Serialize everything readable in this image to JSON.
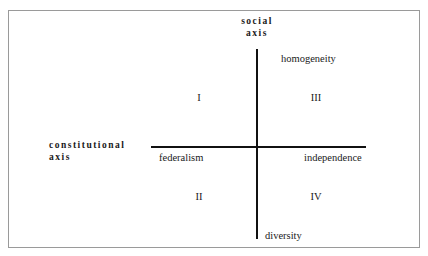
{
  "diagram": {
    "axes": {
      "vertical": {
        "title_line1": "social",
        "title_line2": "axis",
        "positive_pole_label": "homogeneity",
        "negative_pole_label": "diversity"
      },
      "horizontal": {
        "title_line1": "constitutional",
        "title_line2": "axis",
        "negative_pole_label": "federalism",
        "positive_pole_label": "independence"
      }
    },
    "quadrants": [
      {
        "id": "i",
        "numeral": "I"
      },
      {
        "id": "ii",
        "numeral": "II"
      },
      {
        "id": "iii",
        "numeral": "III"
      },
      {
        "id": "iv",
        "numeral": "IV"
      }
    ],
    "colors": {
      "background": "#ffffff",
      "frame_border": "#9a9a9a",
      "axis_line": "#111111",
      "text": "#1a1a1a"
    }
  }
}
